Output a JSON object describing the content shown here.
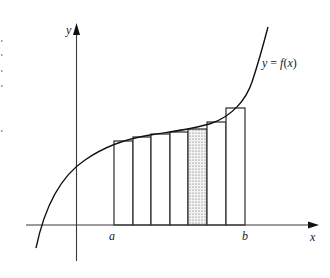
{
  "figure": {
    "labels": {
      "y_axis": "y",
      "x_axis": "x",
      "curve": "y = f(x)",
      "a": "a",
      "b": "b"
    },
    "colors": {
      "line": "#111111",
      "axis": "#3a3a3a",
      "shade": "#bdbdbd",
      "background": "#ffffff"
    },
    "num_rectangles": 7,
    "shaded_rectangle_index": 4,
    "rectangles": [
      {
        "x0": 114,
        "x1": 133,
        "top": 141
      },
      {
        "x0": 133,
        "x1": 151,
        "top": 137
      },
      {
        "x0": 151,
        "x1": 170,
        "top": 134
      },
      {
        "x0": 170,
        "x1": 188,
        "top": 132
      },
      {
        "x0": 188,
        "x1": 207,
        "top": 129
      },
      {
        "x0": 207,
        "x1": 226,
        "top": 122
      },
      {
        "x0": 226,
        "x1": 245,
        "top": 108
      }
    ]
  }
}
